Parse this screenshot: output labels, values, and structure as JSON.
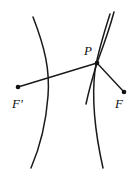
{
  "figure": {
    "type": "geometry-diagram",
    "background_color": "#ffffff",
    "stroke_color": "#1a1a1a",
    "width": 138,
    "height": 171,
    "labels": {
      "focus_left": "F'",
      "focus_right": "F",
      "point_on_curve": "P"
    },
    "points": [
      {
        "name": "focus_left",
        "label": "F'",
        "x": 18,
        "y": 87
      },
      {
        "name": "focus_right",
        "label": "F",
        "x": 124,
        "y": 92
      },
      {
        "name": "point_on_curve",
        "label": "P",
        "x": 97,
        "y": 63
      }
    ],
    "curves": [
      {
        "name": "left-branch",
        "d": "M 33 17 C 45 48, 50 70, 48 96 C 46 124, 40 147, 31 168"
      },
      {
        "name": "right-branch",
        "d": "M 110 14 C 103 36, 98 52, 95 70 C 92 95, 94 128, 103 168"
      },
      {
        "name": "tangent-line",
        "d": "M 114 12 C 108 34, 101 52, 97 63 C 93 76, 89 90, 86 104"
      }
    ],
    "segments": [
      {
        "name": "focal-radius-left",
        "x1": 18,
        "y1": 87,
        "x2": 97,
        "y2": 63
      },
      {
        "name": "focal-radius-right",
        "x1": 97,
        "y1": 63,
        "x2": 124,
        "y2": 92
      }
    ]
  }
}
